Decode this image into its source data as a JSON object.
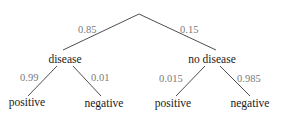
{
  "tree": {
    "root": {
      "branches": [
        {
          "probability": "0.85",
          "label": "disease",
          "children": [
            {
              "probability": "0.99",
              "label": "positive"
            },
            {
              "probability": "0.01",
              "label": "negative"
            }
          ]
        },
        {
          "probability": "0.15",
          "label": "no disease",
          "children": [
            {
              "probability": "0.015",
              "label": "positive"
            },
            {
              "probability": "0.985",
              "label": "negative"
            }
          ]
        }
      ]
    }
  },
  "colors": {
    "node_text": "#1a1a1a",
    "probability_text": "#7a7a7a",
    "edge": "#3a3a3a",
    "background": "#ffffff"
  }
}
